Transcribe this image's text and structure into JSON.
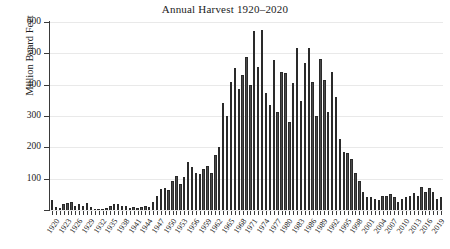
{
  "chart_data": {
    "type": "bar",
    "title": "Annual Harvest 1920–2020",
    "xlabel": "",
    "ylabel": "Million Board Feet",
    "ylim": [
      0,
      600
    ],
    "ytick_values": [
      0,
      100,
      200,
      300,
      400,
      500,
      600
    ],
    "ytick_labels": [
      "",
      "100",
      "200",
      "300",
      "400",
      "500",
      "600"
    ],
    "grid": "horizontal",
    "legend": "none",
    "bar_color": "#4a4a4a",
    "xtick_step": 3,
    "xtick_labels": [
      "1920",
      "1923",
      "1926",
      "1929",
      "1932",
      "1935",
      "1938",
      "1941",
      "1944",
      "1947",
      "1950",
      "1953",
      "1956",
      "1959",
      "1962",
      "1965",
      "1968",
      "1971",
      "1974",
      "1977",
      "1980",
      "1983",
      "1986",
      "1989",
      "1992",
      "1995",
      "1998",
      "2001",
      "2004",
      "2007",
      "2010",
      "2013",
      "2016",
      "2019"
    ],
    "categories": [
      1920,
      1921,
      1922,
      1923,
      1924,
      1925,
      1926,
      1927,
      1928,
      1929,
      1930,
      1931,
      1932,
      1933,
      1934,
      1935,
      1936,
      1937,
      1938,
      1939,
      1940,
      1941,
      1942,
      1943,
      1944,
      1945,
      1946,
      1947,
      1948,
      1949,
      1950,
      1951,
      1952,
      1953,
      1954,
      1955,
      1956,
      1957,
      1958,
      1959,
      1960,
      1961,
      1962,
      1963,
      1964,
      1965,
      1966,
      1967,
      1968,
      1969,
      1970,
      1971,
      1972,
      1973,
      1974,
      1975,
      1976,
      1977,
      1978,
      1979,
      1980,
      1981,
      1982,
      1983,
      1984,
      1985,
      1986,
      1987,
      1988,
      1989,
      1990,
      1991,
      1992,
      1993,
      1994,
      1995,
      1996,
      1997,
      1998,
      1999,
      2000,
      2001,
      2002,
      2003,
      2004,
      2005,
      2006,
      2007,
      2008,
      2009,
      2010,
      2011,
      2012,
      2013,
      2014,
      2015,
      2016,
      2017,
      2018,
      2019,
      2020
    ],
    "values": [
      32,
      10,
      8,
      20,
      22,
      24,
      14,
      20,
      12,
      22,
      10,
      4,
      3,
      3,
      6,
      14,
      18,
      20,
      14,
      12,
      8,
      10,
      7,
      9,
      12,
      10,
      24,
      46,
      66,
      70,
      63,
      92,
      108,
      82,
      104,
      152,
      136,
      118,
      114,
      132,
      142,
      118,
      176,
      200,
      340,
      300,
      410,
      452,
      386,
      432,
      488,
      400,
      570,
      456,
      575,
      374,
      335,
      478,
      312,
      440,
      438,
      282,
      404,
      516,
      348,
      470,
      518,
      410,
      300,
      482,
      414,
      314,
      440,
      360,
      228,
      186,
      182,
      164,
      118,
      92,
      58,
      42,
      40,
      36,
      32,
      44,
      46,
      52,
      40,
      24,
      36,
      42,
      44,
      54,
      46,
      74,
      56,
      70,
      58,
      36,
      42
    ]
  }
}
